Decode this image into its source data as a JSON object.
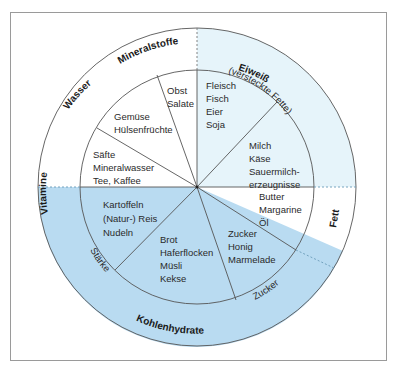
{
  "diagram": {
    "type": "food-group-wheel",
    "colors": {
      "protein_region": "#e6f4fa",
      "carbohydrate_region": "#b9dbf1",
      "lines": "#555555",
      "frame": "#9a9a9a"
    },
    "outer_ring": {
      "vitamine": "Vitamine",
      "wasser": "Wasser",
      "mineralstoffe": "Mineralstoffe",
      "eiweiss": "Eiweiß",
      "versteckte_fette": "(versteckte Fette)",
      "fett": "Fett",
      "zucker": "Zucker",
      "kohlenhydrate": "Kohlenhydrate",
      "staerke": "Stärke"
    },
    "segments": [
      {
        "id": "obst",
        "lines": [
          "Obst",
          "Salate"
        ]
      },
      {
        "id": "fleisch",
        "lines": [
          "Fleisch",
          "Fisch",
          "Eier",
          "Soja"
        ]
      },
      {
        "id": "milch",
        "lines": [
          "Milch",
          "Käse",
          "Sauermilch-",
          "erzeugnisse"
        ]
      },
      {
        "id": "butter",
        "lines": [
          "Butter",
          "Margarine",
          "Öl"
        ]
      },
      {
        "id": "zucker",
        "lines": [
          "Zucker",
          "Honig",
          "Marmelade"
        ]
      },
      {
        "id": "brot",
        "lines": [
          "Brot",
          "Haferflocken",
          "Müsli",
          "Kekse"
        ]
      },
      {
        "id": "kartoffeln",
        "lines": [
          "Kartoffeln",
          "(Natur-) Reis",
          "Nudeln"
        ]
      },
      {
        "id": "saefte",
        "lines": [
          "Säfte",
          "Mineralwasser",
          "Tee, Kaffee"
        ]
      },
      {
        "id": "gemuese",
        "lines": [
          "Gemüse",
          "Hülsenfrüchte"
        ]
      }
    ]
  }
}
